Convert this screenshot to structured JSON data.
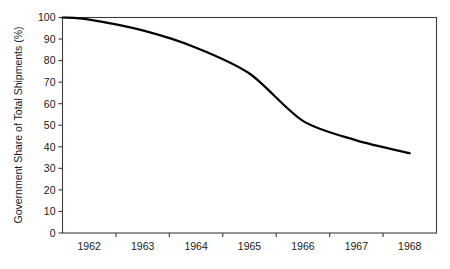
{
  "chart_data": {
    "type": "line",
    "title": "",
    "subtitle": "",
    "xlabel": "",
    "ylabel": "Government Share of Total Shipments (%)",
    "categories": [
      "1962",
      "1963",
      "1964",
      "1965",
      "1966",
      "1967",
      "1968"
    ],
    "x": [
      1962,
      1963,
      1964,
      1965,
      1966,
      1967,
      1968
    ],
    "series": [
      {
        "name": "Government Share of Total Shipments",
        "values": [
          99,
          94,
          86,
          74,
          52,
          43,
          37
        ]
      }
    ],
    "start_point": {
      "label": "1961",
      "value": 100
    },
    "points": [
      {
        "x": "1961",
        "y": 100
      },
      {
        "x": "1962",
        "y": 99
      },
      {
        "x": "1963",
        "y": 94
      },
      {
        "x": "1964",
        "y": 86
      },
      {
        "x": "1965",
        "y": 74
      },
      {
        "x": "1966",
        "y": 52
      },
      {
        "x": "1967",
        "y": 43
      },
      {
        "x": "1968",
        "y": 37
      }
    ],
    "ylim": [
      0,
      100
    ],
    "ytick_step": 10,
    "yticks": [
      0,
      10,
      20,
      30,
      40,
      50,
      60,
      70,
      80,
      90,
      100
    ],
    "ytick_labels": [
      "0",
      "10",
      "20",
      "30",
      "40",
      "50",
      "60",
      "70",
      "80",
      "90",
      "100"
    ],
    "xtick_labels": [
      "1962",
      "1963",
      "1964",
      "1965",
      "1966",
      "1967",
      "1968"
    ],
    "grid": false,
    "legend": false,
    "legend_position": "none",
    "line_color": "#000000",
    "axis_color": "#3c3c3c",
    "background_color": "#ffffff"
  }
}
